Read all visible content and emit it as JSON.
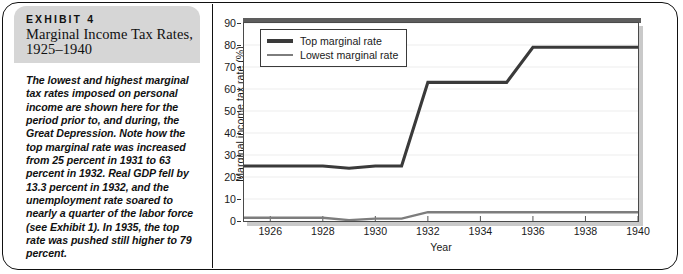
{
  "exhibit": {
    "eyebrow": "EXHIBIT 4",
    "title": "Marginal Income Tax Rates, 1925–1940",
    "caption": "The lowest and highest marginal tax rates imposed on personal income are shown here for the period prior to, and during, the Great Depression. Note how the top marginal rate was increased from 25 percent in 1931 to 63 percent in 1932. Real GDP fell by 13.3 percent in 1932, and the unemployment rate soared to nearly a quarter of the labor force (see Exhibit 1). In 1935, the top rate was pushed still higher to 79 percent."
  },
  "colors": {
    "top_rate_line": "#3a3a3a",
    "lowest_rate_line": "#7d7d7d",
    "header_background": "#d6d6d6",
    "plot_border": "#4a4a4a",
    "gridline": "#ededed",
    "plot_shadow": "#c9c9c9",
    "frame": "#111111"
  },
  "chart_data": {
    "type": "line",
    "title": "",
    "xlabel": "Year",
    "ylabel": "Marginal income tax rate (%)",
    "xlim": [
      1925,
      1940
    ],
    "ylim": [
      0,
      90
    ],
    "yticks": [
      0,
      10,
      20,
      30,
      40,
      50,
      60,
      70,
      80,
      90
    ],
    "xticks": [
      1926,
      1928,
      1930,
      1932,
      1934,
      1936,
      1938,
      1940
    ],
    "xtick_labels": [
      "1926",
      "1928",
      "1930",
      "1932",
      "1934",
      "1936",
      "1938",
      "1940"
    ],
    "ytick_labels": [
      "0",
      "10",
      "20",
      "30",
      "40",
      "50",
      "60",
      "70",
      "80",
      "90"
    ],
    "grid": "horizontal",
    "legend_position": "upper left",
    "x": [
      1925,
      1926,
      1927,
      1928,
      1929,
      1930,
      1931,
      1932,
      1933,
      1934,
      1935,
      1936,
      1937,
      1938,
      1939,
      1940
    ],
    "series": [
      {
        "name": "Top marginal rate",
        "color": "#3a3a3a",
        "values": [
          25,
          25,
          25,
          25,
          24,
          25,
          25,
          63,
          63,
          63,
          63,
          79,
          79,
          79,
          79,
          79
        ]
      },
      {
        "name": "Lowest marginal rate",
        "color": "#7d7d7d",
        "values": [
          1.5,
          1.5,
          1.5,
          1.5,
          0.4,
          1.1,
          1.1,
          4,
          4,
          4,
          4,
          4,
          4,
          4,
          4,
          4
        ]
      }
    ]
  },
  "legend": {
    "items": [
      {
        "label": "Top marginal rate"
      },
      {
        "label": "Lowest marginal rate"
      }
    ]
  }
}
